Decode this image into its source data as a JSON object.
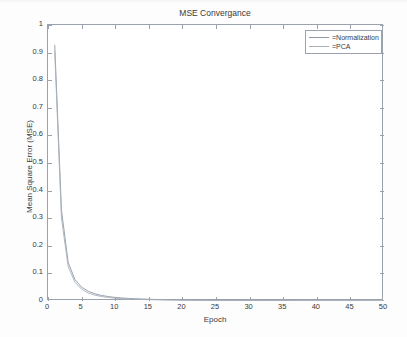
{
  "chart_data": {
    "type": "line",
    "title": "MSE Convergance",
    "xlabel": "Epoch",
    "ylabel": "Mean Square Error (MSE)",
    "xlim": [
      0,
      50
    ],
    "ylim": [
      0,
      1
    ],
    "xticks": [
      0,
      5,
      10,
      15,
      20,
      25,
      30,
      35,
      40,
      45,
      50
    ],
    "yticks": [
      0,
      0.1,
      0.2,
      0.3,
      0.4,
      0.5,
      0.6,
      0.7,
      0.8,
      0.9,
      1
    ],
    "ytick_labels": [
      "0",
      "0.1",
      "0.2",
      "0.3",
      "0.4",
      "0.5",
      "0.6",
      "0.7",
      "0.8",
      "0.9",
      "1"
    ],
    "xtick_labels": [
      "0",
      "5",
      "10",
      "15",
      "20",
      "25",
      "30",
      "35",
      "40",
      "45",
      "50"
    ],
    "grid": false,
    "legend_position": "top-right-inside",
    "x": [
      1,
      2,
      3,
      4,
      5,
      6,
      7,
      8,
      9,
      10,
      11,
      12,
      13,
      14,
      15,
      16,
      17,
      18,
      19,
      20,
      21,
      22,
      23,
      24,
      25,
      26,
      27,
      28,
      29,
      30,
      31,
      32,
      33,
      34,
      35,
      36,
      37,
      38,
      39,
      40,
      41,
      42,
      43,
      44,
      45,
      46,
      47,
      48,
      49,
      50
    ],
    "series": [
      {
        "name": "=Normalization",
        "color": "#8d99a6",
        "values": [
          0.928,
          0.33,
          0.14,
          0.078,
          0.05,
          0.035,
          0.026,
          0.02,
          0.016,
          0.013,
          0.011,
          0.0095,
          0.0082,
          0.0072,
          0.0063,
          0.0056,
          0.005,
          0.0045,
          0.0041,
          0.0037,
          0.0034,
          0.0031,
          0.0029,
          0.0026,
          0.0024,
          0.0023,
          0.0021,
          0.002,
          0.0018,
          0.0017,
          0.0016,
          0.0015,
          0.0014,
          0.0014,
          0.0013,
          0.0012,
          0.0012,
          0.0011,
          0.0011,
          0.001,
          0.001,
          0.0009,
          0.0009,
          0.0008,
          0.0008,
          0.0008,
          0.0007,
          0.0007,
          0.0007,
          0.0006
        ]
      },
      {
        "name": "=PCA",
        "color": "#a8b0b8",
        "values": [
          0.905,
          0.3,
          0.125,
          0.068,
          0.043,
          0.029,
          0.021,
          0.016,
          0.013,
          0.01,
          0.0086,
          0.0074,
          0.0064,
          0.0056,
          0.0049,
          0.0044,
          0.0039,
          0.0035,
          0.0032,
          0.0029,
          0.0027,
          0.0024,
          0.0022,
          0.0021,
          0.0019,
          0.0018,
          0.0017,
          0.0016,
          0.0015,
          0.0014,
          0.0013,
          0.0012,
          0.0011,
          0.0011,
          0.001,
          0.001,
          0.0009,
          0.0009,
          0.0008,
          0.0008,
          0.0008,
          0.0007,
          0.0007,
          0.0007,
          0.0006,
          0.0006,
          0.0006,
          0.0005,
          0.0005,
          0.0005
        ]
      }
    ]
  },
  "legend": {
    "entries": [
      {
        "label": "=Normalization"
      },
      {
        "label": "=PCA"
      }
    ]
  },
  "colors": {
    "axis": "#9aa3ad",
    "text": "#3a3a3a",
    "background": "#ffffff",
    "series_1": "#8d99a6",
    "series_2": "#a8b0b8"
  }
}
